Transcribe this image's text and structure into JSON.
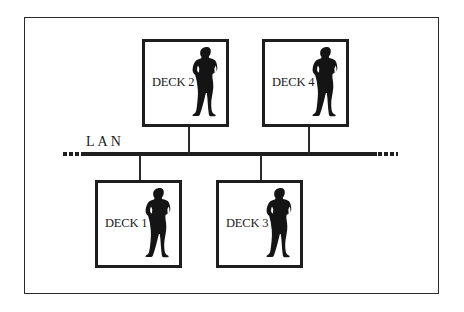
{
  "diagram": {
    "type": "network-topology",
    "network": {
      "label": "LAN"
    },
    "nodes": [
      {
        "id": "deck2",
        "label": "DECK 2",
        "row": "top",
        "icon": "person-silhouette-icon"
      },
      {
        "id": "deck4",
        "label": "DECK 4",
        "row": "top",
        "icon": "person-silhouette-icon"
      },
      {
        "id": "deck1",
        "label": "DECK 1",
        "row": "bottom",
        "icon": "person-silhouette-icon"
      },
      {
        "id": "deck3",
        "label": "DECK 3",
        "row": "bottom",
        "icon": "person-silhouette-icon"
      }
    ],
    "edges": [
      {
        "from": "deck2",
        "to": "LAN"
      },
      {
        "from": "deck4",
        "to": "LAN"
      },
      {
        "from": "deck1",
        "to": "LAN"
      },
      {
        "from": "deck3",
        "to": "LAN"
      }
    ],
    "colors": {
      "line": "#1e1e1e",
      "background": "#ffffff"
    }
  }
}
